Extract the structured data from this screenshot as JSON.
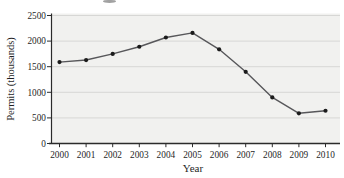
{
  "chart_data": {
    "type": "line",
    "title": "",
    "categories": [
      "2000",
      "2001",
      "2002",
      "2003",
      "2004",
      "2005",
      "2006",
      "2007",
      "2008",
      "2009",
      "2010"
    ],
    "values": [
      1590,
      1630,
      1750,
      1890,
      2070,
      2160,
      1840,
      1400,
      900,
      590,
      640
    ],
    "xlabel": "Year",
    "ylabel": "Permits (thousands)",
    "ylim": [
      0,
      2500
    ],
    "yticks": [
      0,
      500,
      1000,
      1500,
      2000,
      2500
    ],
    "grid": true,
    "legend": "none",
    "marker": "filled-circle",
    "colors": {
      "line": "#57575a",
      "marker": "#1b1b1b",
      "plot_bg": "#f1f1ef",
      "gridline": "#d7d7d5",
      "axis": "#2b2b2b",
      "text": "#1f1f1f",
      "page_bg": "#ffffff"
    }
  }
}
